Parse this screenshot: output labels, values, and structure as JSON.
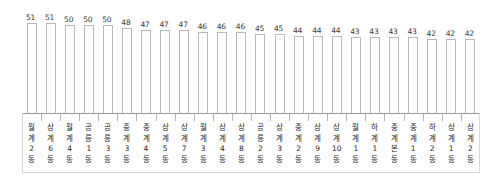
{
  "chart_data": {
    "type": "bar",
    "title": "",
    "subtitle": "",
    "xlabel": "",
    "ylabel": "",
    "ylim": [
      0,
      55
    ],
    "grid": false,
    "legend": "none",
    "orientation": "vertical",
    "bar_fill_color": "#ffffff",
    "bar_border_color": "#b9b9b9",
    "axis_color": "#9a9a9a",
    "label_color": "#1f1f1f",
    "value_label_color": "#3a3a3a",
    "categories": [
      "월계2동",
      "상계6동",
      "월계4동",
      "공릉1동",
      "공릉3동",
      "중계3동",
      "중계4동",
      "상계5동",
      "상계7동",
      "월계3동",
      "상계4동",
      "상계8동",
      "공릉2동",
      "상계3동",
      "중계2동",
      "상계9동",
      "상계10동",
      "월계1동",
      "하계1동",
      "중계본동",
      "중계1동",
      "하계2동",
      "상계1동",
      "상계2동"
    ],
    "values": [
      51,
      51,
      50,
      50,
      50,
      48,
      47,
      47,
      47,
      46,
      46,
      46,
      45,
      45,
      44,
      44,
      44,
      43,
      43,
      43,
      43,
      42,
      42,
      42
    ]
  }
}
